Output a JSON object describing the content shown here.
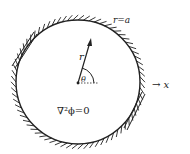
{
  "diagram": {
    "boundary_label": "r=a",
    "radius_label": "r",
    "angle_label": "θ",
    "equation_label": "∇²ϕ=0",
    "axis_label": "→ x",
    "colors": {
      "ink": "#222222",
      "background": "#ffffff"
    }
  }
}
